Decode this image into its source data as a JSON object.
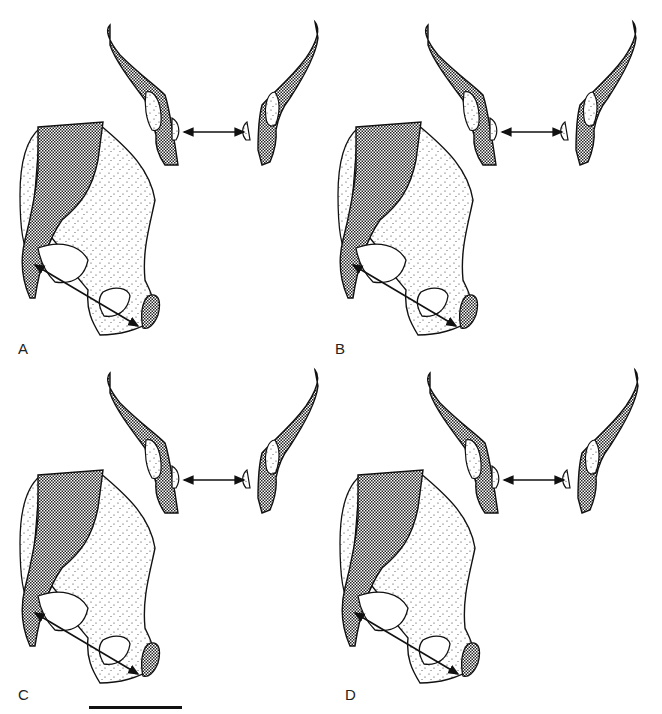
{
  "figure": {
    "panels": [
      {
        "id": "A",
        "label": "A",
        "x": 0,
        "y": 0
      },
      {
        "id": "B",
        "label": "B",
        "x": 330,
        "y": 0
      },
      {
        "id": "C",
        "label": "C",
        "x": 0,
        "y": 360
      },
      {
        "id": "D",
        "label": "D",
        "x": 330,
        "y": 360
      }
    ],
    "legend": {
      "crosshatch": "dense crosshatch pattern (sacrum/pubis regions)",
      "stipple": "stippled pattern (iliac bone)"
    },
    "scale_bar": {
      "visible": true
    },
    "colors": {
      "ink": "#111111",
      "background": "#ffffff"
    }
  }
}
